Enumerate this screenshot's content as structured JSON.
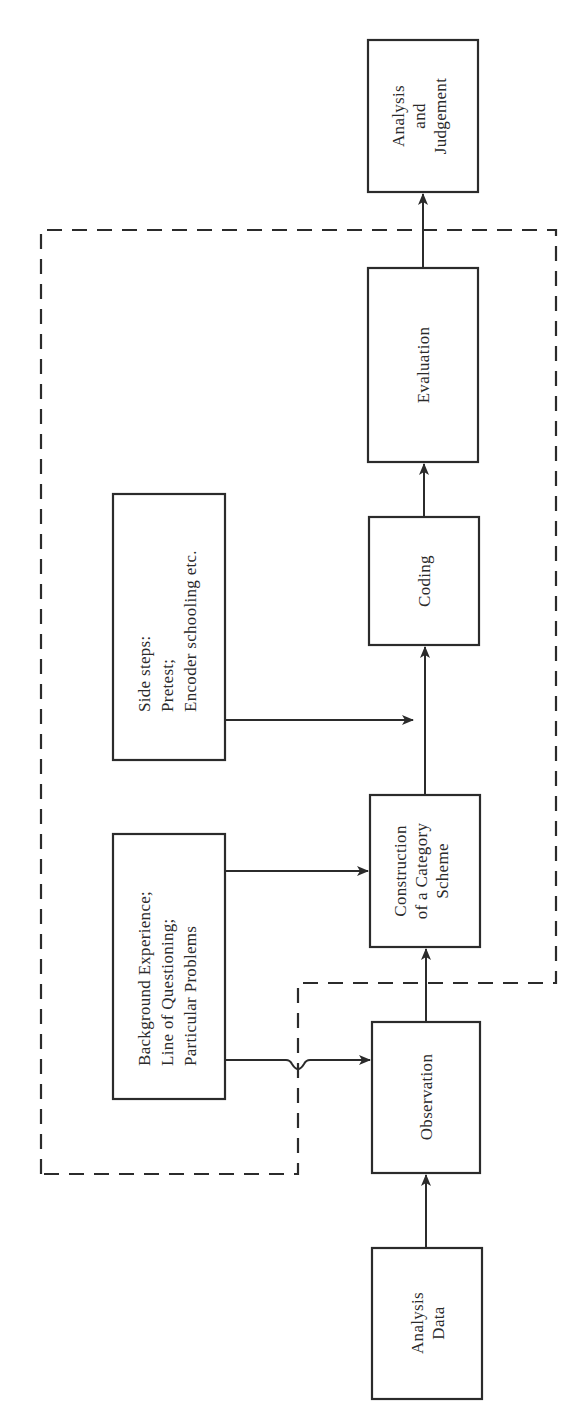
{
  "running_header": "",
  "diagram": {
    "orientation": "rotated 90 degrees counter-clockwise (text reads bottom-to-top)",
    "colors": {
      "stroke": "#2b2b2b",
      "text": "#2a2a2a",
      "background": "#ffffff"
    },
    "main_chain": [
      {
        "id": "analysis-data",
        "lines": [
          "Analysis",
          "Data"
        ]
      },
      {
        "id": "observation",
        "lines": [
          "Observation"
        ]
      },
      {
        "id": "construction",
        "lines": [
          "Construction",
          "of a Category",
          "Scheme"
        ]
      },
      {
        "id": "coding",
        "lines": [
          "Coding"
        ]
      },
      {
        "id": "evaluation",
        "lines": [
          "Evaluation"
        ]
      },
      {
        "id": "analysis-judgement",
        "lines": [
          "Analysis",
          "and",
          "Judgement"
        ]
      }
    ],
    "side_inputs": [
      {
        "id": "background",
        "lines": [
          "Background Experience;",
          "Line of Questioning;",
          "Particular Problems"
        ],
        "targets": [
          "construction",
          "observation"
        ]
      },
      {
        "id": "side-steps",
        "lines": [
          "Side steps:",
          "Pretest;",
          "Encoder schooling etc."
        ],
        "targets": [
          "coding"
        ]
      }
    ],
    "dashed_boundary": {
      "encloses": [
        "observation",
        "construction",
        "coding",
        "evaluation",
        "background",
        "side-steps"
      ]
    }
  }
}
